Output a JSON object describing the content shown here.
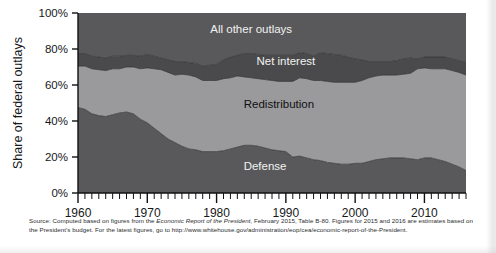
{
  "chart_data": {
    "type": "area",
    "title": "",
    "xlabel": "",
    "ylabel": "Share of federal outlays",
    "xlim": [
      1960,
      2016
    ],
    "ylim": [
      0,
      100
    ],
    "grid": false,
    "legend_position": "inline-annotations",
    "stacked": true,
    "x_tick_labels": [
      "1960",
      "1970",
      "1980",
      "1990",
      "2000",
      "2010"
    ],
    "x_ticks": [
      1960,
      1970,
      1980,
      1990,
      2000,
      2010
    ],
    "y_tick_labels": [
      "0%",
      "20%",
      "40%",
      "60%",
      "80%",
      "100%"
    ],
    "y_ticks": [
      0,
      20,
      40,
      60,
      80,
      100
    ],
    "minor_x_tick_interval": 1,
    "x": [
      1960,
      1961,
      1962,
      1963,
      1964,
      1965,
      1966,
      1967,
      1968,
      1969,
      1970,
      1971,
      1972,
      1973,
      1974,
      1975,
      1976,
      1977,
      1978,
      1979,
      1980,
      1981,
      1982,
      1983,
      1984,
      1985,
      1986,
      1987,
      1988,
      1989,
      1990,
      1991,
      1992,
      1993,
      1994,
      1995,
      1996,
      1997,
      1998,
      1999,
      2000,
      2001,
      2002,
      2003,
      2004,
      2005,
      2006,
      2007,
      2008,
      2009,
      2010,
      2011,
      2012,
      2013,
      2014,
      2015,
      2016
    ],
    "series": [
      {
        "name": "Defense",
        "color": "#59595b",
        "label_color": "#f2f2f2",
        "values": [
          47.5,
          46.5,
          44.0,
          43.0,
          42.5,
          43.5,
          44.5,
          45.0,
          44.0,
          41.0,
          39.0,
          36.0,
          33.0,
          30.0,
          28.0,
          26.0,
          24.5,
          24.0,
          23.0,
          23.0,
          23.0,
          23.5,
          24.5,
          25.5,
          26.5,
          26.5,
          26.0,
          25.0,
          24.0,
          23.5,
          23.0,
          20.0,
          20.5,
          19.5,
          18.5,
          18.0,
          17.0,
          16.5,
          16.0,
          16.0,
          16.5,
          16.5,
          17.5,
          18.5,
          19.0,
          19.5,
          19.5,
          19.5,
          19.0,
          18.5,
          19.5,
          19.5,
          18.5,
          17.5,
          16.0,
          14.5,
          12.5
        ]
      },
      {
        "name": "Redistribution",
        "color": "#9a9a9c",
        "label_color": "#101113",
        "values": [
          23.0,
          24.0,
          25.0,
          25.5,
          25.5,
          25.5,
          24.5,
          25.0,
          26.0,
          28.0,
          30.5,
          33.0,
          35.5,
          37.0,
          37.5,
          40.0,
          41.0,
          40.5,
          39.5,
          39.5,
          39.5,
          40.0,
          39.5,
          39.5,
          38.0,
          37.5,
          37.5,
          38.0,
          38.5,
          38.5,
          39.0,
          42.0,
          43.5,
          44.0,
          44.0,
          44.5,
          45.0,
          45.0,
          45.5,
          45.5,
          45.0,
          46.0,
          46.5,
          46.5,
          46.5,
          46.0,
          46.0,
          46.5,
          47.5,
          50.5,
          50.0,
          49.5,
          50.5,
          51.5,
          52.0,
          52.5,
          53.0
        ]
      },
      {
        "name": "Net interest",
        "color": "#4a4a4c",
        "label_color": "#f2f2f2",
        "values": [
          7.0,
          7.0,
          7.0,
          7.0,
          7.0,
          7.0,
          7.0,
          6.5,
          6.5,
          7.0,
          7.5,
          7.0,
          6.5,
          7.0,
          7.5,
          7.0,
          7.0,
          7.5,
          8.0,
          8.5,
          9.0,
          10.5,
          11.5,
          11.5,
          13.0,
          13.5,
          13.5,
          13.5,
          14.0,
          14.5,
          14.5,
          14.5,
          14.0,
          14.0,
          13.5,
          15.5,
          15.5,
          15.5,
          15.0,
          14.0,
          13.0,
          11.5,
          9.0,
          8.0,
          7.5,
          7.5,
          8.0,
          8.5,
          8.5,
          5.5,
          6.0,
          6.5,
          6.5,
          6.5,
          6.5,
          6.5,
          7.0
        ]
      },
      {
        "name": "All other outlays",
        "color": "#59595b",
        "label_color": "#f2f2f2",
        "values": [
          22.5,
          22.5,
          24.0,
          24.5,
          25.0,
          24.0,
          24.0,
          23.5,
          23.5,
          24.0,
          23.0,
          24.0,
          25.0,
          26.0,
          27.0,
          27.0,
          27.5,
          28.0,
          29.5,
          29.0,
          28.5,
          26.0,
          24.5,
          23.5,
          22.5,
          22.5,
          23.0,
          23.5,
          23.5,
          23.5,
          23.5,
          23.5,
          22.0,
          22.5,
          24.0,
          22.0,
          22.5,
          23.0,
          23.5,
          24.5,
          25.5,
          26.0,
          27.0,
          27.0,
          27.0,
          27.0,
          26.5,
          25.5,
          25.0,
          25.5,
          24.5,
          24.5,
          24.5,
          24.5,
          25.5,
          26.5,
          27.5
        ]
      }
    ],
    "annotations": [
      {
        "text": "All other outlays",
        "x_year": 1985,
        "y_pct": 89
      },
      {
        "text": "Net interest",
        "x_year": 1990,
        "y_pct": 71
      },
      {
        "text": "Redistribution",
        "x_year": 1989,
        "y_pct": 47
      },
      {
        "text": "Defense",
        "x_year": 1987,
        "y_pct": 13
      }
    ]
  },
  "source_note": {
    "prefix": "Source: Computed based on figures from the ",
    "italic_title": "Economic Report of the President",
    "middle": ", February 2015, Table B-80. Figures for 2015 and 2016 are estimates based on the President's budget. For the latest figures, go to http://www.whitehouse.gov/administration/eop/cea/economic-report-of-the-President."
  }
}
